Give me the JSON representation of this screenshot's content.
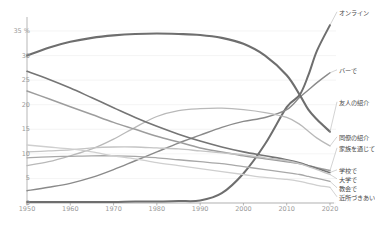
{
  "chart_data": {
    "type": "line",
    "title": "",
    "subtitle": "",
    "xlabel": "",
    "ylabel": "",
    "unit_label": "35 %",
    "xlim": [
      1950,
      2020
    ],
    "ylim": [
      0,
      36
    ],
    "grid": true,
    "legend_position": "right-inline",
    "y_ticks": [
      "35 %",
      "30",
      "25",
      "20",
      "15",
      "10",
      "5",
      "0"
    ],
    "y_tick_values": [
      35,
      30,
      25,
      20,
      15,
      10,
      5,
      0
    ],
    "x_ticks": [
      "1950",
      "1960",
      "1970",
      "1980",
      "1990",
      "2000",
      "2010",
      "2020"
    ],
    "x_tick_values": [
      1950,
      1960,
      1970,
      1980,
      1990,
      2000,
      2010,
      2020
    ],
    "x": [
      1950,
      1955,
      1960,
      1965,
      1970,
      1975,
      1980,
      1985,
      1990,
      1995,
      2000,
      2005,
      2010,
      2013,
      2015,
      2017,
      2020
    ],
    "series": [
      {
        "name": "オンライン",
        "label": "オンライン",
        "color": "#6e6e6e",
        "width": 2.0,
        "label_y": 14,
        "values": [
          0.2,
          0.2,
          0.2,
          0.2,
          0.2,
          0.3,
          0.3,
          0.4,
          0.5,
          2.0,
          6.0,
          12.0,
          19.5,
          22.0,
          26.0,
          31.0,
          39.0
        ]
      },
      {
        "name": "バーで",
        "label": "バーで",
        "color": "#8a8a8a",
        "width": 1.4,
        "label_y": 72,
        "values": [
          2.5,
          3.2,
          4.0,
          5.2,
          6.8,
          8.6,
          10.4,
          12.2,
          13.8,
          15.4,
          16.6,
          17.4,
          19.0,
          21.5,
          23.0,
          24.5,
          26.5
        ]
      },
      {
        "name": "友人の紹介",
        "label": "友人の紹介",
        "color": "#6e6e6e",
        "width": 2.1,
        "label_y": 104,
        "values": [
          30.0,
          31.6,
          32.8,
          33.6,
          34.1,
          34.4,
          34.5,
          34.4,
          34.2,
          33.6,
          32.4,
          30.0,
          26.0,
          22.0,
          19.0,
          17.0,
          14.5
        ]
      },
      {
        "name": "同僚の紹介",
        "label": "同僚の紹介",
        "color": "#b9b9b9",
        "width": 1.3,
        "label_y": 139,
        "values": [
          7.6,
          8.4,
          9.6,
          11.0,
          13.0,
          15.4,
          17.6,
          18.8,
          19.2,
          19.3,
          19.0,
          18.4,
          17.4,
          16.0,
          14.6,
          13.2,
          11.6
        ]
      },
      {
        "name": "家族を通じて",
        "label": "家族を通じて",
        "color": "#9d9d9d",
        "width": 1.5,
        "label_y": 150,
        "values": [
          22.8,
          21.2,
          19.6,
          18.0,
          16.4,
          15.0,
          13.6,
          12.4,
          11.2,
          10.4,
          9.6,
          9.0,
          8.4,
          8.0,
          7.6,
          7.2,
          6.6
        ]
      },
      {
        "name": "学校で",
        "label": "学校で",
        "color": "#757575",
        "width": 1.6,
        "label_y": 172,
        "values": [
          26.8,
          25.2,
          23.4,
          21.4,
          19.4,
          17.4,
          15.6,
          14.0,
          12.6,
          11.4,
          10.4,
          9.6,
          8.8,
          8.2,
          7.6,
          7.0,
          6.2
        ]
      },
      {
        "name": "大学で",
        "label": "大学で",
        "color": "#c4c4c4",
        "width": 1.3,
        "label_y": 181,
        "values": [
          10.4,
          10.6,
          10.8,
          11.2,
          11.4,
          11.4,
          11.2,
          11.0,
          10.6,
          10.2,
          9.8,
          9.2,
          8.6,
          8.0,
          7.4,
          6.8,
          5.8
        ]
      },
      {
        "name": "教会で",
        "label": "教会で",
        "color": "#a8a8a8",
        "width": 1.3,
        "label_y": 190,
        "values": [
          9.2,
          9.4,
          9.5,
          9.6,
          9.6,
          9.5,
          9.2,
          8.8,
          8.4,
          8.0,
          7.4,
          6.8,
          6.2,
          5.8,
          5.4,
          5.0,
          4.4
        ]
      },
      {
        "name": "近所づきあい",
        "label": "近所づきあい",
        "color": "#cfcfcf",
        "width": 1.3,
        "label_y": 199,
        "values": [
          11.8,
          11.4,
          11.0,
          10.4,
          9.6,
          9.0,
          8.2,
          7.6,
          7.0,
          6.4,
          5.8,
          5.2,
          4.8,
          4.4,
          4.0,
          3.6,
          3.2
        ]
      }
    ],
    "axis_color": "#9a9a9a",
    "grid_color": "#ededed",
    "tick_text_color": "#9a9a9a",
    "label_text_color": "#4a4a4a"
  }
}
